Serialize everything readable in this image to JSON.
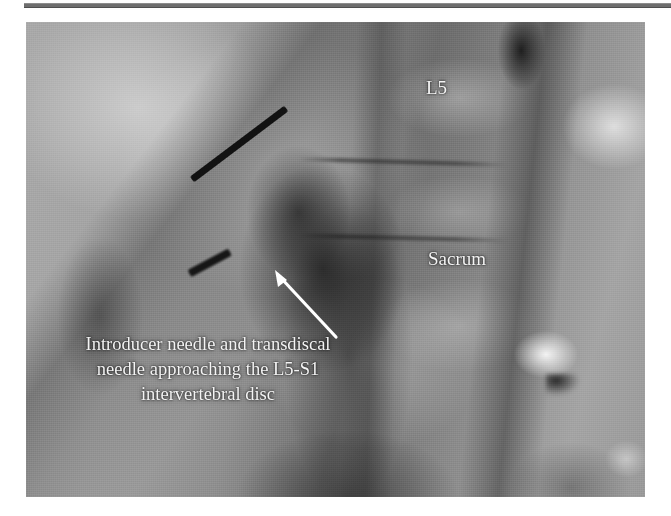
{
  "figure": {
    "modality": "fluoroscopic-spine-image",
    "divider": "horizontal-rule",
    "anatomy_labels": [
      {
        "id": "l5",
        "text": "L5"
      },
      {
        "id": "sacrum",
        "text": "Sacrum"
      }
    ],
    "caption": {
      "lines": [
        "Introducer needle and transdiscal",
        "needle approaching the L5-S1",
        "intervertebral disc"
      ]
    },
    "annotations": {
      "arrow": "leader-arrow-pointing-to-needle-tip"
    },
    "instruments": [
      {
        "id": "transdiscal-needle",
        "name": "transdiscal needle"
      },
      {
        "id": "introducer-needle",
        "name": "introducer needle"
      }
    ],
    "colors": {
      "label_text": "#f4f4f4",
      "arrow": "#ffffff",
      "needle": "#121212",
      "rule": "#6e6e6e",
      "page_background": "#ffffff"
    }
  }
}
